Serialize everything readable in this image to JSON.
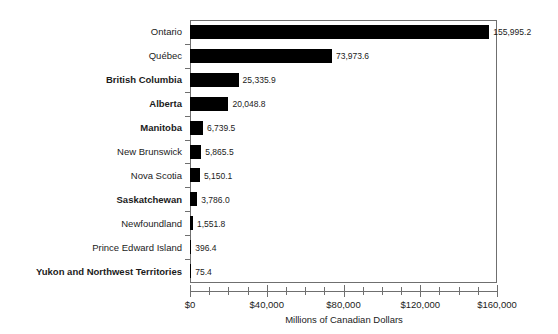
{
  "chart_data": {
    "type": "bar",
    "orientation": "horizontal",
    "title": "",
    "xlabel": "Millions of Canadian Dollars",
    "ylabel": "",
    "xlim": [
      0,
      160000
    ],
    "grid": false,
    "legend": null,
    "bar_color": "#000000",
    "axis_color": "#6f6f6f",
    "background_color": "#ffffff",
    "xticks": [
      {
        "value": 0,
        "label": "$0"
      },
      {
        "value": 40000,
        "label": "$40,000"
      },
      {
        "value": 80000,
        "label": "$80,000"
      },
      {
        "value": 120000,
        "label": "$120,000"
      },
      {
        "value": 160000,
        "label": "$160,000"
      }
    ],
    "minor_tick_interval": 10000,
    "categories": [
      "Ontario",
      "Québec",
      "British Columbia",
      "Alberta",
      "Manitoba",
      "New Brunswick",
      "Nova Scotia",
      "Saskatchewan",
      "Newfoundland",
      "Prince Edward Island",
      "Yukon and Northwest Territories"
    ],
    "values": [
      155995.2,
      73973.6,
      25335.9,
      20048.8,
      6739.5,
      5865.5,
      5150.1,
      3786.0,
      1551.8,
      396.4,
      75.4
    ],
    "value_labels": [
      "155,995.2",
      "73,973.6",
      "25,335.9",
      "20,048.8",
      "6,739.5",
      "5,865.5",
      "5,150.1",
      "3,786.0",
      "1,551.8",
      "396.4",
      "75.4"
    ],
    "bold_categories": [
      "British Columbia",
      "Alberta",
      "Manitoba",
      "Saskatchewan",
      "Yukon and Northwest Territories"
    ]
  }
}
